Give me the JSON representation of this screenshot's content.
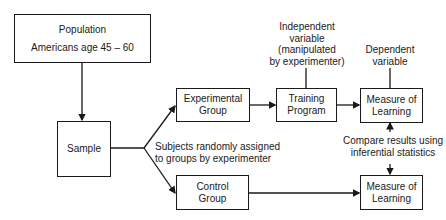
{
  "diagram": {
    "type": "flowchart",
    "nodes": {
      "population": {
        "title": "Population",
        "subtitle": "Americans age 45 – 60"
      },
      "sample": {
        "label": "Sample"
      },
      "experimental_group": {
        "line1": "Experimental",
        "line2": "Group"
      },
      "control_group": {
        "line1": "Control",
        "line2": "Group"
      },
      "training_program": {
        "line1": "Training",
        "line2": "Program"
      },
      "measure_top": {
        "line1": "Measure of",
        "line2": "Learning"
      },
      "measure_bottom": {
        "line1": "Measure of",
        "line2": "Learning"
      }
    },
    "annotations": {
      "independent": [
        "Independent",
        "variable",
        "(manipulated",
        "by experimenter)"
      ],
      "dependent": [
        "Dependent",
        "variable"
      ],
      "random_assign": [
        "Subjects randomly assigned",
        "to groups by experimenter"
      ],
      "compare": [
        "Compare results using",
        "inferential statistics"
      ]
    },
    "edges": [
      {
        "from": "population",
        "to": "sample"
      },
      {
        "from": "sample",
        "to": "experimental_group"
      },
      {
        "from": "sample",
        "to": "control_group"
      },
      {
        "from": "experimental_group",
        "to": "training_program"
      },
      {
        "from": "training_program",
        "to": "measure_top"
      },
      {
        "from": "control_group",
        "to": "measure_bottom"
      },
      {
        "from": "compare",
        "to": "measure_top"
      },
      {
        "from": "compare",
        "to": "measure_bottom"
      }
    ]
  }
}
